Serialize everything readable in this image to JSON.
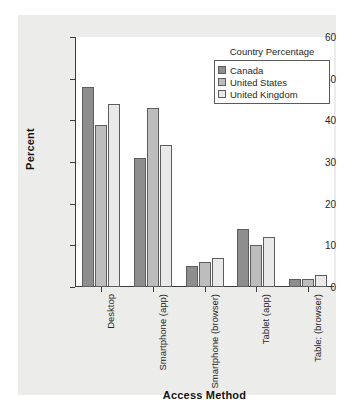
{
  "chart_data": {
    "type": "bar",
    "title": "",
    "xlabel": "Access Method",
    "ylabel": "Percent",
    "ylim": [
      0,
      60
    ],
    "yticks": [
      0,
      10,
      20,
      30,
      40,
      50,
      60
    ],
    "grid": false,
    "legend_position": "top-right",
    "legend_title": "Country Percentage",
    "categories": [
      "Desktop",
      "Smartphone (app)",
      "Smartphone (browser)",
      "Tablet (app)",
      "Table: (browser)"
    ],
    "series": [
      {
        "name": "Canada",
        "color": "#8e8e8e",
        "values": [
          48,
          31,
          5,
          14,
          2
        ]
      },
      {
        "name": "United States",
        "color": "#bdbdbd",
        "values": [
          39,
          43,
          6,
          10,
          2
        ]
      },
      {
        "name": "United Kingdom",
        "color": "#e9e9e9",
        "values": [
          44,
          34,
          7,
          12,
          3
        ]
      }
    ]
  },
  "axis": {
    "y_title": "Percent",
    "x_title": "Access Method",
    "y_tick_labels": [
      "0",
      "10",
      "20",
      "30",
      "40",
      "50",
      "60"
    ]
  },
  "colors": {
    "figure_background": "#ececeb",
    "plot_background": "#ffffff",
    "axis": "#3b3b3b",
    "bar_outline": "#5d5d5d",
    "text": "#262626"
  }
}
